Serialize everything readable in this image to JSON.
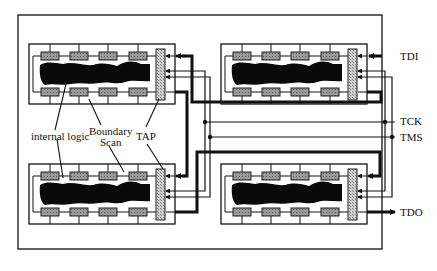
{
  "diagram": {
    "type": "JTAG boundary-scan chain",
    "labels": {
      "internal_logic": "internal logic",
      "boundary_scan_line1": "Boundary",
      "boundary_scan_line2": "Scan",
      "tap": "TAP",
      "tdi": "TDI",
      "tck": "TCK",
      "tms": "TMS",
      "tdo": "TDO"
    },
    "chips": [
      {
        "position": "top-left",
        "cells_per_row": 4
      },
      {
        "position": "top-right",
        "cells_per_row": 4
      },
      {
        "position": "bottom-left",
        "cells_per_row": 4
      },
      {
        "position": "bottom-right",
        "cells_per_row": 4
      }
    ],
    "colors": {
      "line": "#111111",
      "cell_fill": "#8a8a8a",
      "tap_fill": "#c8c8c8",
      "logic_fill": "#0a0a0a",
      "background": "#ffffff"
    }
  }
}
